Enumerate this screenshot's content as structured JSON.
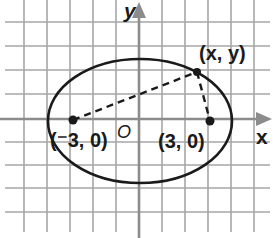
{
  "diagram": {
    "type": "ellipse-on-coordinate-grid",
    "axes": {
      "x_label": "x",
      "y_label": "y",
      "origin_label": "O"
    },
    "foci": [
      {
        "label": "(⁻3, 0)",
        "x": -3,
        "y": 0
      },
      {
        "label": "(3, 0)",
        "x": 3,
        "y": 0
      }
    ],
    "point_on_ellipse": {
      "label": "(x, y)"
    },
    "colors": {
      "grid": "#a6a6a6",
      "axis": "#8c8c8c",
      "curve": "#1a1a1a"
    }
  }
}
